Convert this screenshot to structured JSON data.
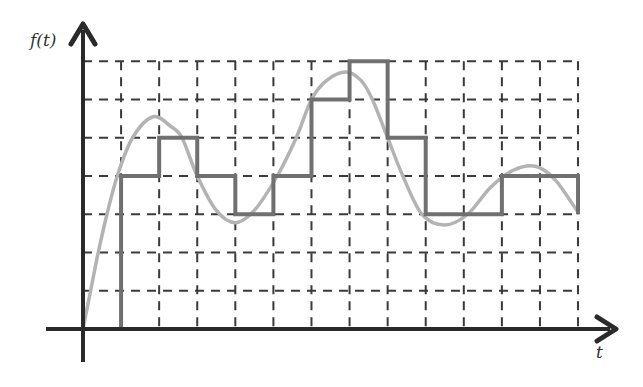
{
  "chart_data": {
    "type": "line",
    "title": "",
    "xlabel": "t",
    "ylabel": "f(t)",
    "xlim": [
      0,
      13
    ],
    "ylim": [
      0,
      7
    ],
    "grid": true,
    "grid_style": "dashed",
    "x_gridlines": [
      1,
      2,
      3,
      4,
      5,
      6,
      7,
      8,
      9,
      10,
      11,
      12,
      13
    ],
    "y_gridlines": [
      1,
      2,
      3,
      4,
      5,
      6,
      7
    ],
    "legend": null,
    "series": [
      {
        "name": "continuous signal",
        "style": "smooth",
        "color": "#b3b3b3",
        "points": [
          [
            0,
            0
          ],
          [
            0.2,
            1
          ],
          [
            0.4,
            2
          ],
          [
            0.63,
            3
          ],
          [
            0.9,
            4
          ],
          [
            1.3,
            5
          ],
          [
            1.84,
            5.55
          ],
          [
            2.3,
            5.3
          ],
          [
            2.6,
            5
          ],
          [
            3.0,
            4
          ],
          [
            3.5,
            3.1
          ],
          [
            4.0,
            2.78
          ],
          [
            4.5,
            3.1
          ],
          [
            5.1,
            4
          ],
          [
            5.6,
            5
          ],
          [
            6.0,
            6
          ],
          [
            6.4,
            6.5
          ],
          [
            6.9,
            6.72
          ],
          [
            7.3,
            6.5
          ],
          [
            7.6,
            6
          ],
          [
            8.0,
            5
          ],
          [
            8.4,
            4
          ],
          [
            8.9,
            3
          ],
          [
            9.5,
            2.72
          ],
          [
            10.1,
            3
          ],
          [
            10.7,
            3.7
          ],
          [
            11.3,
            4.15
          ],
          [
            11.9,
            4.25
          ],
          [
            12.4,
            3.9
          ],
          [
            13,
            3.05
          ]
        ]
      },
      {
        "name": "quantized step signal",
        "style": "step",
        "color": "#707070",
        "x": [
          0,
          1,
          2,
          3,
          4,
          5,
          6,
          7,
          8,
          9,
          10,
          11,
          12,
          13
        ],
        "values": [
          0,
          4,
          5,
          4,
          3,
          4,
          6,
          7,
          5,
          3,
          3,
          4,
          4,
          3
        ]
      }
    ]
  },
  "labels": {
    "y_axis": "f(t)",
    "x_axis": "t"
  },
  "colors": {
    "axis": "#2a2a2a",
    "grid": "#3a3a3a",
    "curve": "#b3b3b3",
    "step": "#707070"
  }
}
